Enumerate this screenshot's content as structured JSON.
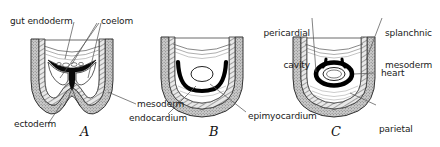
{
  "figure": {
    "background_color": "#ffffff",
    "ink_color": "#1a1a1a",
    "leader_line_color": "#555555",
    "mesoderm_fill": "#b3b3b3",
    "ectoderm_fill": "#9a9a9a",
    "heart_tube_color": "#000000",
    "coelom_fill": "#ffffff"
  },
  "panels": [
    {
      "letter": "A",
      "caption_note": "Paired coelomic cavities flank the gut endoderm; splanchnic mesoderm thickened.",
      "labels": [
        {
          "id": "gut-endoderm",
          "text": "gut endoderm"
        },
        {
          "id": "coelom",
          "text": "coelom"
        },
        {
          "id": "ectoderm",
          "text": "ectoderm"
        },
        {
          "id": "mesoderm",
          "text": "mesoderm"
        }
      ]
    },
    {
      "letter": "B",
      "caption_note": "Endocardial tubes fuse; epimyocardium forms the outer heart wall.",
      "labels": [
        {
          "id": "endocardium",
          "text": "endocardium"
        },
        {
          "id": "epimyocardium",
          "text": "epimyocardium"
        }
      ]
    },
    {
      "letter": "C",
      "caption_note": "Heart tube suspended within pericardial cavity.",
      "labels": [
        {
          "id": "pericardial-cavity",
          "line1": "pericardial",
          "line2": "cavity"
        },
        {
          "id": "splanchnic-mesoderm",
          "line1": "splanchnic",
          "line2": "mesoderm"
        },
        {
          "id": "heart",
          "text": "heart"
        },
        {
          "id": "parietal-mesoderm",
          "line1": "parietal",
          "line2": "mesoderm"
        }
      ]
    }
  ],
  "labels": {
    "gut_endoderm": "gut endoderm",
    "coelom": "coelom",
    "ectoderm": "ectoderm",
    "mesoderm": "mesoderm",
    "endocardium": "endocardium",
    "epimyocardium": "epimyocardium",
    "pericardial_cavity_l1": "pericardial",
    "pericardial_cavity_l2": "cavity",
    "splanchnic_mesoderm_l1": "splanchnic",
    "splanchnic_mesoderm_l2": "mesoderm",
    "heart": "heart",
    "parietal_mesoderm_l1": "parietal",
    "parietal_mesoderm_l2": "mesoderm",
    "letter_a": "A",
    "letter_b": "B",
    "letter_c": "C"
  }
}
